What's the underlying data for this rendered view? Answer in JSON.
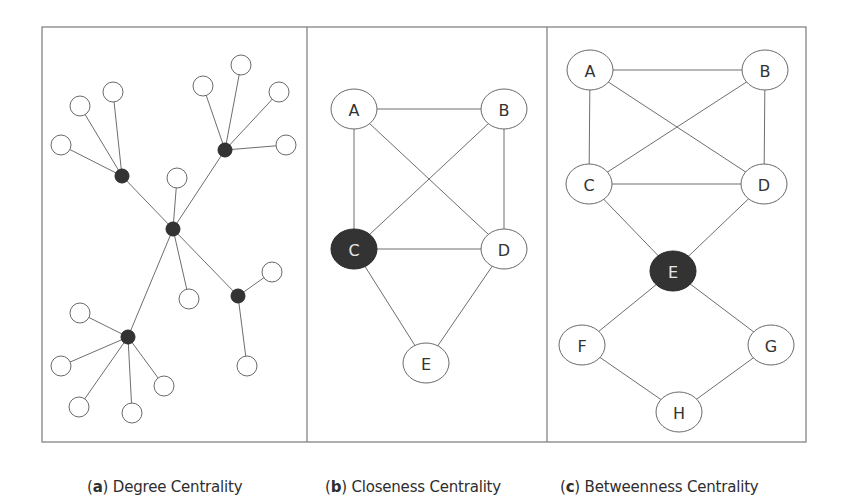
{
  "figure": {
    "frame": {
      "x": 42,
      "y": 27,
      "width": 764,
      "height": 415,
      "dividers": [
        307,
        547
      ]
    },
    "colors": {
      "stroke": "#6e6e6e",
      "highlight_fill": "#333333",
      "node_fill": "#ffffff",
      "frame": "#7a7a7a"
    },
    "panels": [
      {
        "id": "a",
        "caption_letter": "a",
        "caption_text": "Degree Centrality",
        "caption_x": 87,
        "node_style": "unlabeled-circles",
        "nodes": [
          {
            "id": "center",
            "x": 173,
            "y": 229,
            "r": 7,
            "highlight": true
          },
          {
            "id": "hubTL",
            "x": 122,
            "y": 176,
            "r": 7,
            "highlight": true
          },
          {
            "id": "hubTR",
            "x": 225,
            "y": 150,
            "r": 7,
            "highlight": true
          },
          {
            "id": "hubR",
            "x": 238,
            "y": 296,
            "r": 7,
            "highlight": true
          },
          {
            "id": "hubBL",
            "x": 128,
            "y": 337,
            "r": 7,
            "highlight": true
          },
          {
            "id": "l1",
            "x": 61,
            "y": 145,
            "r": 10
          },
          {
            "id": "l2",
            "x": 80,
            "y": 106,
            "r": 10
          },
          {
            "id": "l3",
            "x": 113,
            "y": 92,
            "r": 10
          },
          {
            "id": "l4",
            "x": 203,
            "y": 86,
            "r": 10
          },
          {
            "id": "l5",
            "x": 241,
            "y": 65,
            "r": 10
          },
          {
            "id": "l6",
            "x": 279,
            "y": 92,
            "r": 10
          },
          {
            "id": "l7",
            "x": 286,
            "y": 145,
            "r": 10
          },
          {
            "id": "l8",
            "x": 177,
            "y": 178,
            "r": 10
          },
          {
            "id": "l9",
            "x": 189,
            "y": 299,
            "r": 10
          },
          {
            "id": "l10",
            "x": 272,
            "y": 272,
            "r": 10
          },
          {
            "id": "l11",
            "x": 247,
            "y": 366,
            "r": 10
          },
          {
            "id": "l12",
            "x": 80,
            "y": 313,
            "r": 10
          },
          {
            "id": "l13",
            "x": 61,
            "y": 366,
            "r": 10
          },
          {
            "id": "l14",
            "x": 79,
            "y": 407,
            "r": 10
          },
          {
            "id": "l15",
            "x": 132,
            "y": 413,
            "r": 10
          },
          {
            "id": "l16",
            "x": 164,
            "y": 386,
            "r": 10
          }
        ],
        "edges": [
          [
            "center",
            "hubTL"
          ],
          [
            "center",
            "hubTR"
          ],
          [
            "center",
            "hubR"
          ],
          [
            "center",
            "hubBL"
          ],
          [
            "center",
            "l8"
          ],
          [
            "center",
            "l9"
          ],
          [
            "hubTL",
            "l1"
          ],
          [
            "hubTL",
            "l2"
          ],
          [
            "hubTL",
            "l3"
          ],
          [
            "hubTR",
            "l4"
          ],
          [
            "hubTR",
            "l5"
          ],
          [
            "hubTR",
            "l6"
          ],
          [
            "hubTR",
            "l7"
          ],
          [
            "hubR",
            "l10"
          ],
          [
            "hubR",
            "l11"
          ],
          [
            "hubBL",
            "l12"
          ],
          [
            "hubBL",
            "l13"
          ],
          [
            "hubBL",
            "l14"
          ],
          [
            "hubBL",
            "l15"
          ],
          [
            "hubBL",
            "l16"
          ]
        ]
      },
      {
        "id": "b",
        "caption_letter": "b",
        "caption_text": "Closeness Centrality",
        "caption_x": 325,
        "node_style": "labeled-ellipses",
        "nodes": [
          {
            "id": "A",
            "label": "A",
            "x": 354,
            "y": 109,
            "rx": 23,
            "ry": 20
          },
          {
            "id": "B",
            "label": "B",
            "x": 504,
            "y": 109,
            "rx": 23,
            "ry": 20
          },
          {
            "id": "C",
            "label": "C",
            "x": 354,
            "y": 249,
            "rx": 23,
            "ry": 20,
            "highlight": true
          },
          {
            "id": "D",
            "label": "D",
            "x": 504,
            "y": 249,
            "rx": 23,
            "ry": 20
          },
          {
            "id": "E",
            "label": "E",
            "x": 426,
            "y": 363,
            "rx": 23,
            "ry": 20
          }
        ],
        "edges": [
          [
            "A",
            "B"
          ],
          [
            "A",
            "C"
          ],
          [
            "A",
            "D"
          ],
          [
            "B",
            "C"
          ],
          [
            "B",
            "D"
          ],
          [
            "C",
            "D"
          ],
          [
            "C",
            "E"
          ],
          [
            "D",
            "E"
          ]
        ]
      },
      {
        "id": "c",
        "caption_letter": "c",
        "caption_text": "Betweenness Centrality",
        "caption_x": 560,
        "node_style": "labeled-ellipses",
        "nodes": [
          {
            "id": "A",
            "label": "A",
            "x": 590,
            "y": 70,
            "rx": 23,
            "ry": 20
          },
          {
            "id": "B",
            "label": "B",
            "x": 765,
            "y": 70,
            "rx": 23,
            "ry": 20
          },
          {
            "id": "C",
            "label": "C",
            "x": 589,
            "y": 184,
            "rx": 23,
            "ry": 20
          },
          {
            "id": "D",
            "label": "D",
            "x": 764,
            "y": 184,
            "rx": 23,
            "ry": 20
          },
          {
            "id": "E",
            "label": "E",
            "x": 673,
            "y": 271,
            "rx": 23,
            "ry": 20,
            "highlight": true
          },
          {
            "id": "F",
            "label": "F",
            "x": 582,
            "y": 345,
            "rx": 23,
            "ry": 20
          },
          {
            "id": "G",
            "label": "G",
            "x": 771,
            "y": 345,
            "rx": 23,
            "ry": 20
          },
          {
            "id": "H",
            "label": "H",
            "x": 679,
            "y": 412,
            "rx": 23,
            "ry": 20
          }
        ],
        "edges": [
          [
            "A",
            "B"
          ],
          [
            "A",
            "C"
          ],
          [
            "A",
            "D"
          ],
          [
            "B",
            "C"
          ],
          [
            "B",
            "D"
          ],
          [
            "C",
            "D"
          ],
          [
            "C",
            "E"
          ],
          [
            "D",
            "E"
          ],
          [
            "E",
            "F"
          ],
          [
            "E",
            "G"
          ],
          [
            "F",
            "H"
          ],
          [
            "G",
            "H"
          ]
        ]
      }
    ]
  },
  "captions": {
    "a": {
      "letter": "a",
      "text": "Degree Centrality"
    },
    "b": {
      "letter": "b",
      "text": "Closeness Centrality"
    },
    "c": {
      "letter": "c",
      "text": "Betweenness Centrality"
    }
  }
}
